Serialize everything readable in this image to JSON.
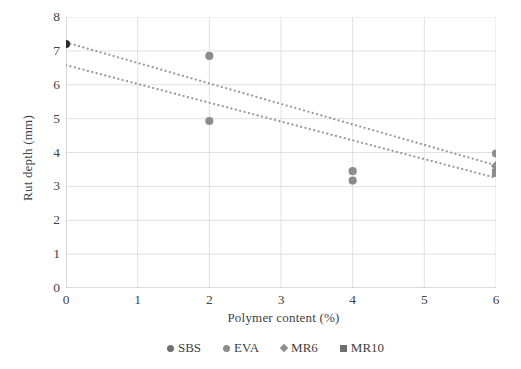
{
  "chart_data": {
    "type": "scatter",
    "title": "",
    "xlabel": "Polymer content (%)",
    "ylabel": "Rut depth (mm)",
    "xlim": [
      0,
      6
    ],
    "ylim": [
      0,
      8
    ],
    "xticks": [
      "0",
      "1",
      "2",
      "3",
      "4",
      "5",
      "6"
    ],
    "yticks": [
      "0",
      "1",
      "2",
      "3",
      "4",
      "5",
      "6",
      "7",
      "8"
    ],
    "grid": "both",
    "legend_position": "bottom",
    "series": [
      {
        "name": "SBS",
        "marker": "circle",
        "color": "#2b2b2b",
        "points": [
          {
            "x": 0,
            "y": 7.2
          }
        ]
      },
      {
        "name": "EVA",
        "marker": "circle",
        "color": "#8c8c8c",
        "points": [
          {
            "x": 2,
            "y": 6.85
          },
          {
            "x": 2,
            "y": 4.93
          },
          {
            "x": 4,
            "y": 3.45
          },
          {
            "x": 4,
            "y": 3.17
          },
          {
            "x": 6,
            "y": 3.97
          }
        ]
      },
      {
        "name": "MR6",
        "marker": "diamond",
        "color": "#8c8c8c",
        "points": [
          {
            "x": 6,
            "y": 3.6
          }
        ]
      },
      {
        "name": "MR10",
        "marker": "square",
        "color": "#8c8c8c",
        "points": [
          {
            "x": 6,
            "y": 3.4
          }
        ]
      }
    ],
    "trendlines": [
      {
        "name": "upper-trendline",
        "style": "dotted",
        "color": "#9a9a9a",
        "x0": 0,
        "y0": 7.25,
        "x1": 6,
        "y1": 3.62
      },
      {
        "name": "lower-trendline",
        "style": "dotted",
        "color": "#9a9a9a",
        "x0": 0,
        "y0": 6.58,
        "x1": 6,
        "y1": 3.25
      }
    ]
  },
  "legend": {
    "items": [
      {
        "label": "SBS",
        "marker": "circle",
        "color": "#6f6f6f"
      },
      {
        "label": "EVA",
        "marker": "circle",
        "color": "#8c8c8c"
      },
      {
        "label": "MR6",
        "marker": "diamond",
        "color": "#8c8c8c"
      },
      {
        "label": "MR10",
        "marker": "square",
        "color": "#6f6f6f"
      }
    ]
  }
}
